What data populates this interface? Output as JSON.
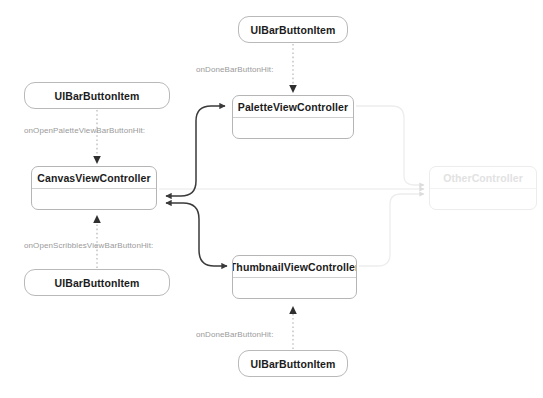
{
  "diagram": {
    "kind": "storyboard-segue-graph",
    "background": "#ffffff",
    "colors": {
      "node_border": "#b5b5b5",
      "pill_border": "#b9b9b9",
      "node_title_text": "#1b1b1b",
      "edge_label_text": "#9a9a9a",
      "segue_stroke": "#3a3a3a",
      "ghost_stroke": "#e8e8e8",
      "ghost_text": "#e2e2e2"
    },
    "nodes": [
      {
        "id": "btn-done-palette",
        "type": "pill",
        "label": "UIBarButtonItem",
        "x": 238,
        "y": 16,
        "w": 110,
        "h": 27
      },
      {
        "id": "btn-open-palette",
        "type": "pill",
        "label": "UIBarButtonItem",
        "x": 24,
        "y": 82,
        "w": 146,
        "h": 27
      },
      {
        "id": "btn-open-scribbles",
        "type": "pill",
        "label": "UIBarButtonItem",
        "x": 24,
        "y": 269,
        "w": 146,
        "h": 27
      },
      {
        "id": "btn-done-thumbnail",
        "type": "pill",
        "label": "UIBarButtonItem",
        "x": 238,
        "y": 350,
        "w": 110,
        "h": 27
      },
      {
        "id": "vc-palette",
        "type": "vc",
        "label": "PaletteViewController",
        "x": 232,
        "y": 95,
        "w": 122,
        "h": 44
      },
      {
        "id": "vc-canvas",
        "type": "vc",
        "label": "CanvasViewController",
        "x": 31,
        "y": 166,
        "w": 126,
        "h": 44
      },
      {
        "id": "vc-thumbnail",
        "type": "vc",
        "label": "ThumbnailViewController",
        "x": 232,
        "y": 255,
        "w": 125,
        "h": 44
      },
      {
        "id": "vc-other",
        "type": "vc",
        "label": "OtherController",
        "x": 429,
        "y": 166,
        "w": 108,
        "h": 44,
        "ghost": true
      }
    ],
    "edge_labels": [
      {
        "id": "lbl-done-palette",
        "text": "onDoneBarButtonHit:",
        "x": 196,
        "y": 65
      },
      {
        "id": "lbl-open-palette",
        "text": "onOpenPaletteViewBarButtonHit:",
        "x": 24,
        "y": 126
      },
      {
        "id": "lbl-open-scribbles",
        "text": "onOpenScribblesViewBarButtonHit:",
        "x": 24,
        "y": 241
      },
      {
        "id": "lbl-done-thumbnail",
        "text": "onDoneBarButtonHit:",
        "x": 196,
        "y": 330
      }
    ],
    "edges": [
      {
        "id": "edge-done-palette-action",
        "style": "dotted",
        "from": "btn-done-palette",
        "to": "vc-palette",
        "arrow": "end"
      },
      {
        "id": "edge-open-palette-action",
        "style": "dotted",
        "from": "btn-open-palette",
        "to": "vc-canvas",
        "arrow": "end"
      },
      {
        "id": "edge-open-scribbles-action",
        "style": "dotted",
        "from": "btn-open-scribbles",
        "to": "vc-canvas",
        "arrow": "end"
      },
      {
        "id": "edge-done-thumbnail-action",
        "style": "dotted",
        "from": "btn-done-thumbnail",
        "to": "vc-thumbnail",
        "arrow": "end"
      },
      {
        "id": "edge-canvas-palette",
        "style": "solid",
        "from": "vc-canvas",
        "to": "vc-palette",
        "arrow": "both"
      },
      {
        "id": "edge-canvas-thumbnail",
        "style": "solid",
        "from": "vc-canvas",
        "to": "vc-thumbnail",
        "arrow": "both"
      },
      {
        "id": "edge-palette-other",
        "style": "ghost",
        "from": "vc-palette",
        "to": "vc-other",
        "arrow": "end"
      },
      {
        "id": "edge-canvas-other",
        "style": "ghost",
        "from": "vc-canvas",
        "to": "vc-other",
        "arrow": "end"
      },
      {
        "id": "edge-thumbnail-other",
        "style": "ghost",
        "from": "vc-thumbnail",
        "to": "vc-other",
        "arrow": "end"
      }
    ]
  }
}
